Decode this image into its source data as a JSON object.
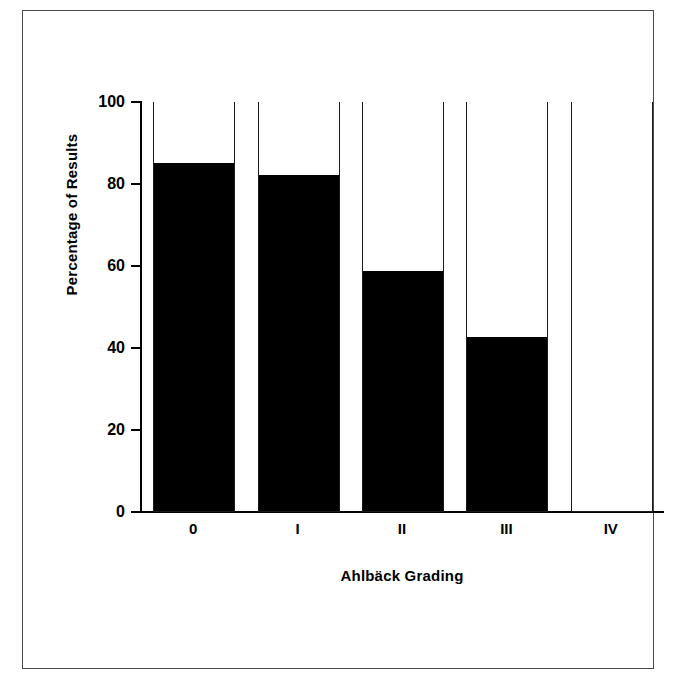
{
  "figure": {
    "frame_color": "#4a4a4a",
    "background": "#ffffff"
  },
  "chart_data": {
    "type": "bar",
    "subtype": "stacked-100-percent",
    "title": "",
    "xlabel": "Ahlbäck Grading",
    "ylabel": "Percentage of Results",
    "categories": [
      "0",
      "I",
      "II",
      "III",
      "IV"
    ],
    "ylim": [
      0,
      100
    ],
    "yticks": [
      0,
      20,
      40,
      60,
      80,
      100
    ],
    "ytick_labels": [
      "0",
      "20",
      "40",
      "60",
      "80",
      "100"
    ],
    "grid": false,
    "legend": null,
    "series": [
      {
        "name": "filled",
        "color": "#000000",
        "values": [
          85,
          82,
          58.5,
          42.5,
          0
        ]
      },
      {
        "name": "open",
        "color": "#ffffff",
        "values": [
          15,
          18,
          41.5,
          57.5,
          100
        ]
      }
    ]
  }
}
